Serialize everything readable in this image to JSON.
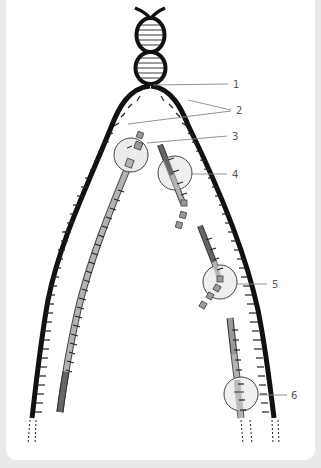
{
  "diagram": {
    "labels": [
      {
        "id": "1",
        "text": "1",
        "x": 233,
        "y": 87
      },
      {
        "id": "2",
        "text": "2",
        "x": 236,
        "y": 112
      },
      {
        "id": "3",
        "text": "3",
        "x": 232,
        "y": 139
      },
      {
        "id": "4",
        "text": "4",
        "x": 232,
        "y": 177
      },
      {
        "id": "5",
        "text": "5",
        "x": 272,
        "y": 288
      },
      {
        "id": "6",
        "text": "6",
        "x": 291,
        "y": 399
      }
    ],
    "colors": {
      "parent_strand": "#111111",
      "leading_strand": "#b3b3b3",
      "lagging_fragment": "#666666",
      "primer": "#999999",
      "enzyme_circle": "#ebebeb",
      "enzyme_outline": "#444444",
      "nucleotide": "#9a9a9a",
      "leader_line": "#888888",
      "background": "#e9e9e9",
      "panel": "#ffffff"
    }
  }
}
